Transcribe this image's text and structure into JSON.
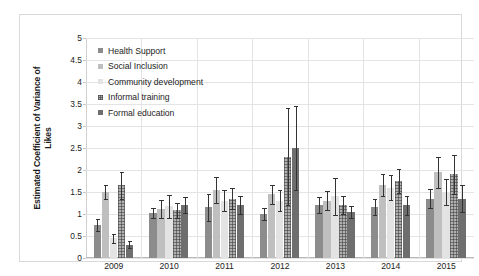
{
  "chart_data": {
    "type": "bar",
    "title": "",
    "subtitle": "",
    "xlabel": "",
    "ylabel": "Estimated Coefficient of Variance of Likes",
    "ylabel_lines": [
      "Estimated Coefficient of Variance of",
      "Likes"
    ],
    "ylim": [
      0,
      5
    ],
    "ytick_step": 0.5,
    "yticks": [
      "5",
      "4.5",
      "4",
      "3.5",
      "3",
      "2.5",
      "2",
      "1.5",
      "1",
      "0.5",
      "0"
    ],
    "categories": [
      "2009",
      "2010",
      "2011",
      "2012",
      "2013",
      "2014",
      "2015"
    ],
    "grid": true,
    "grid_axis": "y",
    "legend_position": "top-left-inside",
    "series": [
      {
        "name": "Health Support",
        "color": "#8c8c8c",
        "pattern": "solid",
        "values": [
          0.75,
          1.02,
          1.15,
          1.0,
          1.2,
          1.15,
          1.35
        ],
        "err_upper": [
          0.13,
          0.12,
          0.3,
          0.14,
          0.18,
          0.18,
          0.22
        ],
        "err_lower": [
          0.13,
          0.12,
          0.3,
          0.14,
          0.18,
          0.18,
          0.22
        ]
      },
      {
        "name": "Social Inclusion",
        "color": "#bfbfbf",
        "pattern": "solid",
        "values": [
          1.5,
          1.12,
          1.55,
          1.45,
          1.3,
          1.65,
          1.95
        ],
        "err_upper": [
          0.16,
          0.2,
          0.3,
          0.22,
          0.22,
          0.25,
          0.35
        ],
        "err_lower": [
          0.16,
          0.2,
          0.3,
          0.22,
          0.22,
          0.25,
          0.35
        ]
      },
      {
        "name": "Community development",
        "color": "#e3e3e3",
        "pattern": "solid",
        "values": [
          0.45,
          1.18,
          1.3,
          1.3,
          1.4,
          1.6,
          1.5
        ],
        "err_upper": [
          0.1,
          0.26,
          0.24,
          0.24,
          0.42,
          0.28,
          0.3
        ],
        "err_lower": [
          0.1,
          0.26,
          0.24,
          0.24,
          0.42,
          0.28,
          0.3
        ]
      },
      {
        "name": "Informal training",
        "color": "#b0b0b0",
        "pattern": "crosshatch",
        "values": [
          1.65,
          1.08,
          1.35,
          2.3,
          1.2,
          1.75,
          1.9
        ],
        "err_upper": [
          0.3,
          0.18,
          0.24,
          1.1,
          0.2,
          0.28,
          0.45
        ],
        "err_lower": [
          0.3,
          0.18,
          0.24,
          1.1,
          0.2,
          0.28,
          0.45
        ]
      },
      {
        "name": "Formal education",
        "color": "#6e6e6e",
        "pattern": "solid",
        "values": [
          0.3,
          1.2,
          1.2,
          2.5,
          1.05,
          1.2,
          1.35
        ],
        "err_upper": [
          0.08,
          0.18,
          0.2,
          0.95,
          0.14,
          0.22,
          0.3
        ],
        "err_lower": [
          0.08,
          0.18,
          0.2,
          0.95,
          0.14,
          0.22,
          0.3
        ]
      }
    ]
  },
  "legend": {
    "items": [
      {
        "label": "Health Support"
      },
      {
        "label": "Social Inclusion"
      },
      {
        "label": "Community development"
      },
      {
        "label": "Informal training"
      },
      {
        "label": "Formal education"
      }
    ]
  },
  "colors": {
    "frame": "#d9d9d9",
    "gridline": "#e4e4e4",
    "axis": "#b9b9b9",
    "text": "#1c1c1c",
    "error_bar": "#333333",
    "background": "#ffffff"
  }
}
